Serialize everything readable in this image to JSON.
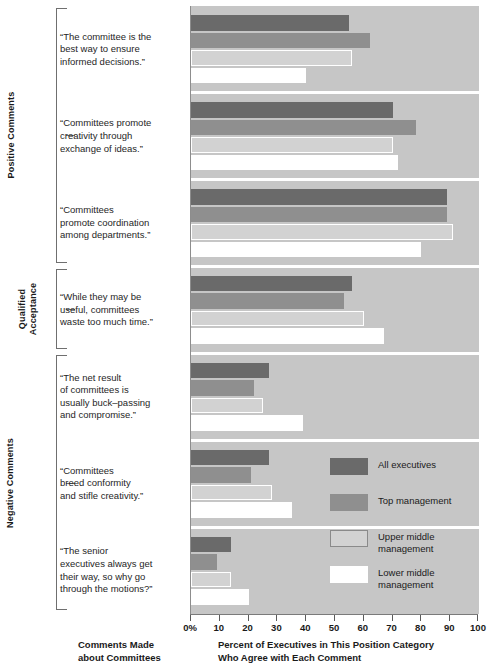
{
  "axis_caption": "Comments Made\nabout Committees",
  "x_axis_caption": "Percent of Executives in This Position Category\nWho Agree with Each Comment",
  "groups": [
    {
      "label": "Positive Comments"
    },
    {
      "label": "Qualified Acceptance"
    },
    {
      "label": "Negative Comments"
    }
  ],
  "legend": [
    {
      "label": "All executives",
      "color": "#6a6a6a"
    },
    {
      "label": "Top management",
      "color": "#8f8f8f"
    },
    {
      "label": "Upper middle\nmanagement",
      "color": "#d2d2d2"
    },
    {
      "label": "Lower middle\nmanagement",
      "color": "#ffffff"
    }
  ],
  "comments": [
    "“The committee is the\nbest way to ensure\ninformed decisions.”",
    "“Committees promote\ncreativity through\nexchange of ideas.”",
    "“Committees\npromote coordination\namong departments.”",
    "“While they may be\nuseful, committees\nwaste too much time.”",
    "“The net result\nof committees is\nusually buck–passing\nand compromise.”",
    "“Committees\nbreed conformity\nand stifle creativity.”",
    "“The senior\nexecutives always get\ntheir way, so why go\nthrough the motions?”"
  ],
  "chart_data": {
    "type": "bar",
    "orientation": "horizontal",
    "title": "",
    "xlabel": "Percent of Executives in This Position Category Who Agree with Each Comment",
    "ylabel": "Comments Made about Committees",
    "xlim": [
      0,
      100
    ],
    "xticks": [
      0,
      10,
      20,
      30,
      40,
      50,
      60,
      70,
      80,
      90,
      100
    ],
    "xticklabels": [
      "0%",
      "10",
      "20",
      "30",
      "40",
      "50",
      "60",
      "70",
      "80",
      "90",
      "100"
    ],
    "grid": false,
    "legend_position": "inside-right",
    "series": [
      {
        "name": "All executives",
        "color": "#6a6a6a",
        "values": [
          55,
          70,
          89,
          56,
          27,
          27,
          14
        ]
      },
      {
        "name": "Top management",
        "color": "#8f8f8f",
        "values": [
          62,
          78,
          89,
          53,
          22,
          21,
          9
        ]
      },
      {
        "name": "Upper middle management",
        "color": "#d2d2d2",
        "values": [
          56,
          70,
          91,
          60,
          25,
          28,
          14
        ]
      },
      {
        "name": "Lower middle management",
        "color": "#ffffff",
        "values": [
          40,
          72,
          80,
          67,
          39,
          35,
          20
        ]
      }
    ],
    "categories": [
      "“The committee is the best way to ensure informed decisions.”",
      "“Committees promote creativity through exchange of ideas.”",
      "“Committees promote coordination among departments.”",
      "“While they may be useful, committees waste too much time.”",
      "“The net result of committees is usually buck–passing and compromise.”",
      "“Committees breed conformity and stifle creativity.”",
      "“The senior executives always get their way, so why go through the motions?”"
    ],
    "category_groups": [
      {
        "label": "Positive Comments",
        "indices": [
          0,
          1,
          2
        ]
      },
      {
        "label": "Qualified Acceptance",
        "indices": [
          3
        ]
      },
      {
        "label": "Negative Comments",
        "indices": [
          4,
          5,
          6
        ]
      }
    ]
  }
}
